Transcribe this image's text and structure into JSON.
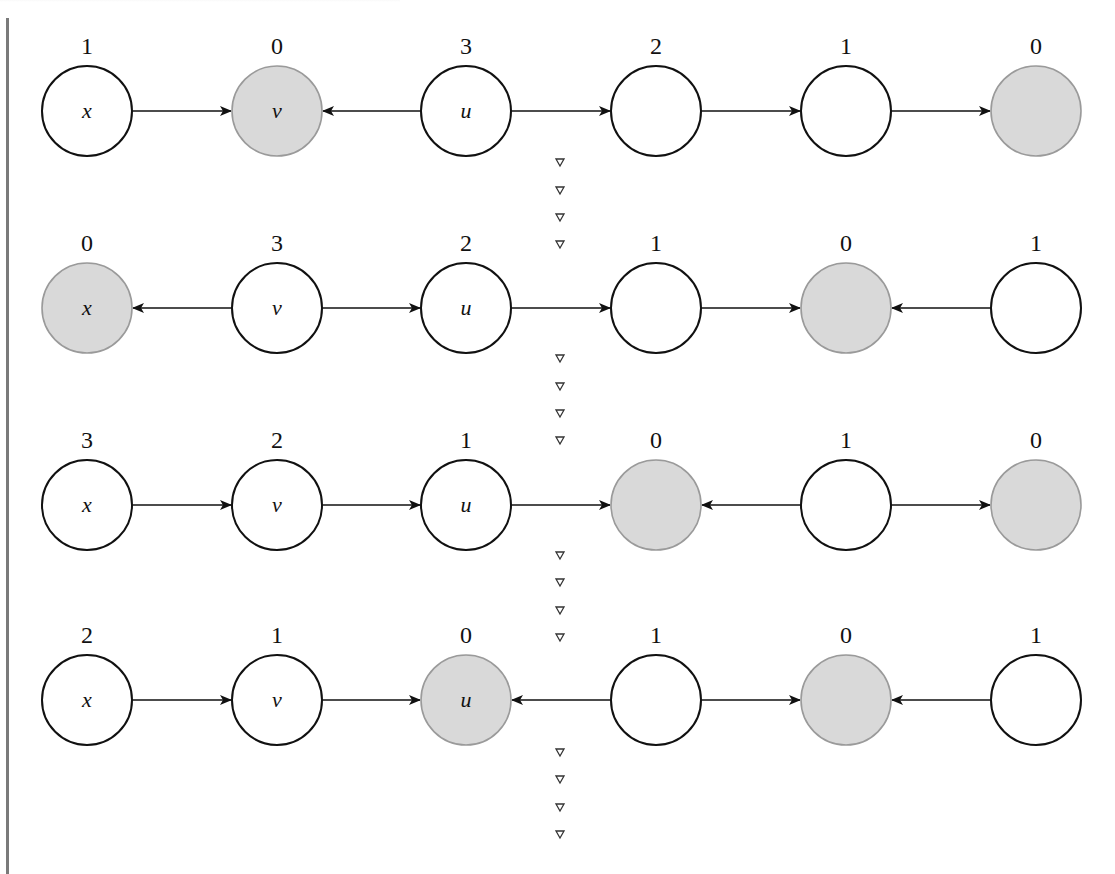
{
  "figure": {
    "rule_color": "#7a7a7a",
    "colors": {
      "stroke": "#111111",
      "shaded_fill": "#d9d9d9",
      "shaded_stroke": "#9a9a9a",
      "unshaded_fill": "#ffffff",
      "triangle": "#333333"
    },
    "node_x": [
      87,
      277,
      466,
      656,
      846,
      1036
    ],
    "node_radius": 45,
    "triangles_x": 560,
    "rows": [
      {
        "y": 111,
        "nodes": [
          {
            "name": "x",
            "value": "1",
            "shaded": false
          },
          {
            "name": "v",
            "value": "0",
            "shaded": true
          },
          {
            "name": "u",
            "value": "3",
            "shaded": false
          },
          {
            "name": "",
            "value": "2",
            "shaded": false
          },
          {
            "name": "",
            "value": "1",
            "shaded": false
          },
          {
            "name": "",
            "value": "0",
            "shaded": true
          }
        ],
        "edges": [
          "right",
          "left",
          "right",
          "right",
          "right"
        ],
        "triangles_y": [
          162,
          190,
          217,
          244
        ]
      },
      {
        "y": 308,
        "nodes": [
          {
            "name": "x",
            "value": "0",
            "shaded": true
          },
          {
            "name": "v",
            "value": "3",
            "shaded": false
          },
          {
            "name": "u",
            "value": "2",
            "shaded": false
          },
          {
            "name": "",
            "value": "1",
            "shaded": false
          },
          {
            "name": "",
            "value": "0",
            "shaded": true
          },
          {
            "name": "",
            "value": "1",
            "shaded": false
          }
        ],
        "edges": [
          "left",
          "right",
          "right",
          "right",
          "left"
        ],
        "triangles_y": [
          358,
          386,
          413,
          440
        ]
      },
      {
        "y": 505,
        "nodes": [
          {
            "name": "x",
            "value": "3",
            "shaded": false
          },
          {
            "name": "v",
            "value": "2",
            "shaded": false
          },
          {
            "name": "u",
            "value": "1",
            "shaded": false
          },
          {
            "name": "",
            "value": "0",
            "shaded": true
          },
          {
            "name": "",
            "value": "1",
            "shaded": false
          },
          {
            "name": "",
            "value": "0",
            "shaded": true
          }
        ],
        "edges": [
          "right",
          "right",
          "right",
          "left",
          "right"
        ],
        "triangles_y": [
          555,
          582,
          610,
          637
        ]
      },
      {
        "y": 700,
        "nodes": [
          {
            "name": "x",
            "value": "2",
            "shaded": false
          },
          {
            "name": "v",
            "value": "1",
            "shaded": false
          },
          {
            "name": "u",
            "value": "0",
            "shaded": true
          },
          {
            "name": "",
            "value": "1",
            "shaded": false
          },
          {
            "name": "",
            "value": "0",
            "shaded": true
          },
          {
            "name": "",
            "value": "1",
            "shaded": false
          }
        ],
        "edges": [
          "right",
          "right",
          "left",
          "right",
          "left"
        ],
        "triangles_y": [
          752,
          779,
          807,
          834
        ]
      }
    ]
  }
}
